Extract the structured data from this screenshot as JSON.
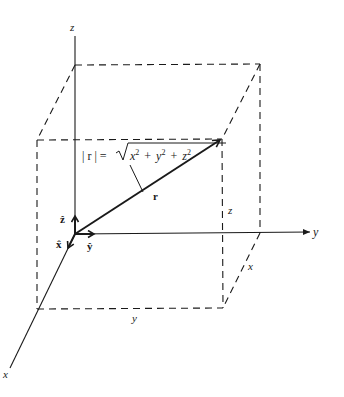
{
  "diagram": {
    "colors": {
      "ink": "#1a1a1a",
      "background": "#ffffff"
    },
    "axes": {
      "x_label": "x",
      "y_label": "y",
      "z_label": "z"
    },
    "unit_vectors": {
      "x_hat": "x̂",
      "y_hat": "ŷ",
      "z_hat": "ẑ"
    },
    "vector": {
      "label": "r",
      "magnitude_lhs": "| r | =",
      "radicand": {
        "x": "x",
        "y": "y",
        "z": "z",
        "exp": "2",
        "plus": "+"
      }
    },
    "edge_labels": {
      "z_edge": "z",
      "x_edge": "x",
      "y_edge": "y"
    }
  }
}
